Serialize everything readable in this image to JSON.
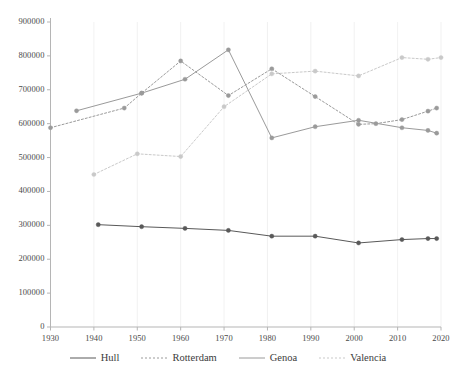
{
  "chart_data": {
    "type": "line",
    "title": "",
    "xlabel": "",
    "ylabel": "",
    "xlim": [
      1930,
      2020
    ],
    "ylim": [
      0,
      900000
    ],
    "grid": true,
    "grid_orientation": "vertical",
    "legend_position": "bottom",
    "x_ticks": [
      1930,
      1940,
      1950,
      1960,
      1970,
      1980,
      1990,
      2000,
      2010,
      2020
    ],
    "y_ticks": [
      0,
      100000,
      200000,
      300000,
      400000,
      500000,
      600000,
      700000,
      800000,
      900000
    ],
    "series": [
      {
        "name": "Hull",
        "style": "solid",
        "color": "#595959",
        "marker": "circle",
        "points": [
          {
            "x": 1941,
            "y": 302000
          },
          {
            "x": 1951,
            "y": 296000
          },
          {
            "x": 1961,
            "y": 291000
          },
          {
            "x": 1971,
            "y": 285000
          },
          {
            "x": 1981,
            "y": 268000
          },
          {
            "x": 1991,
            "y": 268000
          },
          {
            "x": 2001,
            "y": 248000
          },
          {
            "x": 2011,
            "y": 258000
          },
          {
            "x": 2017,
            "y": 261000
          },
          {
            "x": 2019,
            "y": 261000
          }
        ]
      },
      {
        "name": "Rotterdam",
        "style": "dotted",
        "color": "#9a9a9a",
        "marker": "circle",
        "points": [
          {
            "x": 1930,
            "y": 588000
          },
          {
            "x": 1947,
            "y": 646000
          },
          {
            "x": 1951,
            "y": 690000
          },
          {
            "x": 1960,
            "y": 785000
          },
          {
            "x": 1971,
            "y": 683000
          },
          {
            "x": 1981,
            "y": 762000
          },
          {
            "x": 1991,
            "y": 680000
          },
          {
            "x": 2001,
            "y": 598000
          },
          {
            "x": 2005,
            "y": 600000
          },
          {
            "x": 2011,
            "y": 612000
          },
          {
            "x": 2017,
            "y": 637000
          },
          {
            "x": 2019,
            "y": 646000
          }
        ]
      },
      {
        "name": "Genoa",
        "style": "solid",
        "color": "#9a9a9a",
        "marker": "circle",
        "points": [
          {
            "x": 1936,
            "y": 638000
          },
          {
            "x": 1951,
            "y": 690000
          },
          {
            "x": 1961,
            "y": 731000
          },
          {
            "x": 1971,
            "y": 818000
          },
          {
            "x": 1981,
            "y": 558000
          },
          {
            "x": 1991,
            "y": 591000
          },
          {
            "x": 2001,
            "y": 610000
          },
          {
            "x": 2011,
            "y": 588000
          },
          {
            "x": 2017,
            "y": 580000
          },
          {
            "x": 2019,
            "y": 572000
          }
        ]
      },
      {
        "name": "Valencia",
        "style": "dotted",
        "color": "#c9c9c9",
        "marker": "circle",
        "points": [
          {
            "x": 1940,
            "y": 450000
          },
          {
            "x": 1950,
            "y": 511000
          },
          {
            "x": 1960,
            "y": 503000
          },
          {
            "x": 1970,
            "y": 650000
          },
          {
            "x": 1981,
            "y": 747000
          },
          {
            "x": 1991,
            "y": 755000
          },
          {
            "x": 2001,
            "y": 741000
          },
          {
            "x": 2011,
            "y": 795000
          },
          {
            "x": 2017,
            "y": 790000
          },
          {
            "x": 2020,
            "y": 795000
          }
        ]
      }
    ]
  },
  "legend": {
    "items": [
      {
        "label": "Hull"
      },
      {
        "label": "Rotterdam"
      },
      {
        "label": "Genoa"
      },
      {
        "label": "Valencia"
      }
    ]
  }
}
